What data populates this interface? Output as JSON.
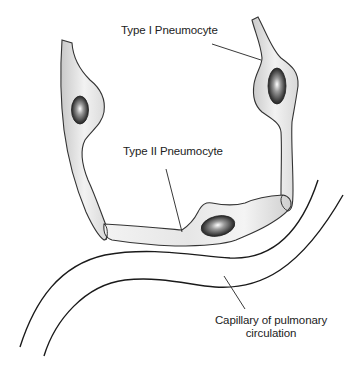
{
  "diagram": {
    "labels": {
      "type1": "Type I Pneumocyte",
      "type2": "Type II Pneumocyte",
      "capillary_line1": "Capillary of pulmonary",
      "capillary_line2": "circulation"
    },
    "colors": {
      "wall_fill_light": "#f4f4f4",
      "wall_fill_dark": "#c8c8c8",
      "outline": "#333333",
      "nucleus_dark": "#2a2a2a",
      "nucleus_highlight": "#ffffff"
    }
  }
}
